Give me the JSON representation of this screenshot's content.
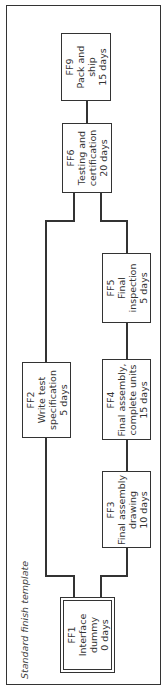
{
  "diagram": {
    "title": "Standard finish template",
    "orientation": "rotated 90deg counter-clockwise",
    "nodes": [
      {
        "id": "FF1",
        "name": "Interface dummy",
        "duration": "0 days",
        "lines": [
          "FF1",
          "Interface",
          "dummy",
          "0 days"
        ],
        "style": "double-border"
      },
      {
        "id": "FF2",
        "name": "Write test specification",
        "duration": "5 days",
        "lines": [
          "FF2",
          "Write test",
          "specification",
          "5 days"
        ]
      },
      {
        "id": "FF3",
        "name": "Final assembly drawing",
        "duration": "10 days",
        "lines": [
          "FF3",
          "Final assembly",
          "drawing",
          "10 days"
        ]
      },
      {
        "id": "FF4",
        "name": "Final assembly, complete units",
        "duration": "15 days",
        "lines": [
          "FF4",
          "Final assembly,",
          "complete units",
          "15 days"
        ]
      },
      {
        "id": "FF5",
        "name": "Final inspection",
        "duration": "5 days",
        "lines": [
          "FF5",
          "Final",
          "inspection",
          "5 days"
        ]
      },
      {
        "id": "FF6",
        "name": "Testing and certification",
        "duration": "20 days",
        "lines": [
          "FF6",
          "Testing and",
          "certification",
          "20 days"
        ]
      },
      {
        "id": "FF9",
        "name": "Pack and ship",
        "duration": "15 days",
        "lines": [
          "FF9",
          "Pack and",
          "ship",
          "15 days"
        ]
      }
    ],
    "edges": [
      {
        "from": "FF1",
        "to": "FF2"
      },
      {
        "from": "FF1",
        "to": "FF3"
      },
      {
        "from": "FF3",
        "to": "FF4"
      },
      {
        "from": "FF4",
        "to": "FF5"
      },
      {
        "from": "FF2",
        "to": "FF6"
      },
      {
        "from": "FF5",
        "to": "FF6"
      },
      {
        "from": "FF6",
        "to": "FF9"
      }
    ]
  }
}
